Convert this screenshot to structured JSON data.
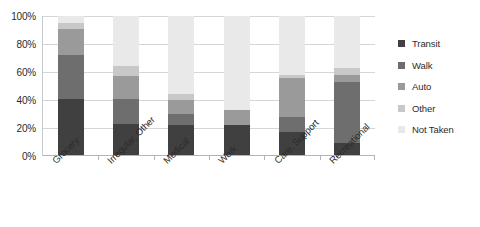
{
  "chart_data": {
    "type": "bar",
    "subtype": "stacked-percentage-column",
    "title": "",
    "xlabel": "",
    "ylabel": "",
    "ylim": [
      0,
      100
    ],
    "ytick_labels": [
      "0%",
      "20%",
      "40%",
      "60%",
      "80%",
      "100%"
    ],
    "ytick_values": [
      0,
      20,
      40,
      60,
      80,
      100
    ],
    "grid": true,
    "legend_position": "right",
    "categories": [
      "Grocery",
      "Irregular, Other",
      "Medical",
      "Work",
      "Care, Support",
      "Recreational"
    ],
    "series": [
      {
        "name": "Transit",
        "color": "#404040",
        "values": [
          41,
          23,
          22,
          22,
          17,
          9
        ]
      },
      {
        "name": "Walk",
        "color": "#6e6e6e",
        "values": [
          31,
          18,
          8,
          0,
          11,
          44
        ]
      },
      {
        "name": "Auto",
        "color": "#9a9a9a",
        "values": [
          19,
          16,
          10,
          11,
          28,
          5
        ]
      },
      {
        "name": "Other",
        "color": "#c8c8c8",
        "values": [
          4,
          7,
          4,
          0,
          2,
          5
        ]
      },
      {
        "name": "Not Taken",
        "color": "#e9e9e9",
        "values": [
          5,
          36,
          56,
          67,
          42,
          37
        ]
      }
    ]
  },
  "legend": {
    "items": [
      {
        "label": "Transit",
        "color": "#404040"
      },
      {
        "label": "Walk",
        "color": "#6e6e6e"
      },
      {
        "label": "Auto",
        "color": "#9a9a9a"
      },
      {
        "label": "Other",
        "color": "#c8c8c8"
      },
      {
        "label": "Not Taken",
        "color": "#e9e9e9"
      }
    ]
  }
}
